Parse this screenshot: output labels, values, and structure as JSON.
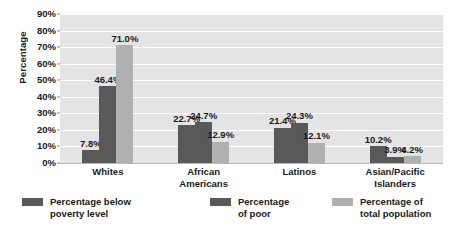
{
  "chart_data": {
    "type": "bar",
    "title": "",
    "xlabel": "",
    "ylabel": "Percentage",
    "ylim": [
      0,
      90
    ],
    "grid": true,
    "legend_position": "bottom",
    "categories": [
      "Whites",
      "African\nAmericans",
      "Latinos",
      "Asian/Pacific\nIslanders"
    ],
    "y_ticks": [
      "0%",
      "10%",
      "20%",
      "30%",
      "40%",
      "50%",
      "60%",
      "70%",
      "80%",
      "90%"
    ],
    "y_tick_values": [
      0,
      10,
      20,
      30,
      40,
      50,
      60,
      70,
      80,
      90
    ],
    "series": [
      {
        "name": "Percentage below\npoverty level",
        "color": "#595959",
        "values": [
          7.8,
          22.7,
          21.4,
          10.2
        ],
        "labels": [
          "7.8%",
          "22.7%",
          "21.4%",
          "10.2%"
        ]
      },
      {
        "name": "Percentage\nof poor",
        "color": "#595959",
        "values": [
          46.4,
          24.7,
          24.3,
          3.9
        ],
        "labels": [
          "46.4%",
          "24.7%",
          "24.3%",
          "3.9%"
        ]
      },
      {
        "name": "Percentage of\ntotal population",
        "color": "#b0b0b0",
        "values": [
          71.0,
          12.9,
          12.1,
          4.2
        ],
        "labels": [
          "71.0%",
          "12.9%",
          "12.1%",
          "4.2%"
        ]
      }
    ],
    "colors": {
      "plot_background": "#e4e4e4",
      "gridline": "#ffffff",
      "text": "#1a1a1a",
      "series_dark": "#595959",
      "series_light": "#b0b0b0"
    }
  }
}
